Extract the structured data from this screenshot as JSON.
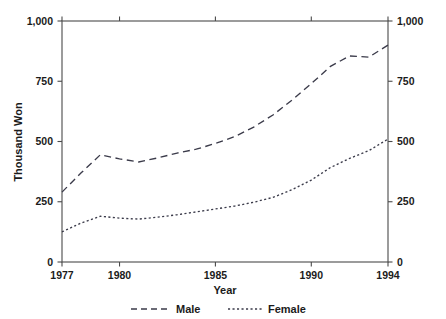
{
  "chart_data": {
    "type": "line",
    "title": "",
    "xlabel": "Year",
    "ylabel": "Thousand Won",
    "xlim": [
      1977,
      1994
    ],
    "ylim": [
      0,
      1000
    ],
    "grid": false,
    "legend_position": "bottom",
    "x_ticks": [
      1977,
      1980,
      1985,
      1990,
      1994
    ],
    "x_tick_labels": [
      "1977",
      "1980",
      "1985",
      "1990",
      "1994"
    ],
    "y_ticks": [
      0,
      250,
      500,
      750,
      1000
    ],
    "y_tick_labels": [
      "0",
      "250",
      "500",
      "750",
      "1,000"
    ],
    "y_axis_right_labels": [
      "0",
      "250",
      "500",
      "750",
      "1,000"
    ],
    "x": [
      1977,
      1978,
      1979,
      1980,
      1981,
      1982,
      1983,
      1984,
      1985,
      1986,
      1987,
      1988,
      1989,
      1990,
      1991,
      1992,
      1993,
      1994
    ],
    "series": [
      {
        "name": "Male",
        "line_style": "dashed",
        "color": "#3b3b4a",
        "values": [
          290,
          370,
          445,
          428,
          415,
          432,
          452,
          468,
          492,
          520,
          560,
          610,
          672,
          740,
          812,
          855,
          850,
          900
        ]
      },
      {
        "name": "Female",
        "line_style": "dotted",
        "color": "#3b3b4a",
        "values": [
          125,
          162,
          190,
          182,
          178,
          186,
          196,
          208,
          220,
          232,
          248,
          268,
          300,
          340,
          392,
          430,
          462,
          510
        ]
      }
    ]
  },
  "legend": {
    "entries": [
      {
        "label": "Male"
      },
      {
        "label": "Female"
      }
    ]
  },
  "axes": {
    "y_left_title": "Thousand Won",
    "x_title": "Year"
  }
}
